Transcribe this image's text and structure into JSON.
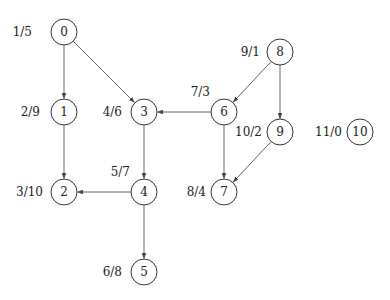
{
  "graph": {
    "type": "directed",
    "nodes": [
      {
        "id": "0",
        "x": 64,
        "y": 32,
        "label": "1/5",
        "lx": 32,
        "ly": 36,
        "anchor": "end"
      },
      {
        "id": "1",
        "x": 64,
        "y": 112,
        "label": "2/9",
        "lx": 40,
        "ly": 116,
        "anchor": "end"
      },
      {
        "id": "2",
        "x": 64,
        "y": 192,
        "label": "3/10",
        "lx": 43,
        "ly": 196,
        "anchor": "end"
      },
      {
        "id": "3",
        "x": 144,
        "y": 112,
        "label": "4/6",
        "lx": 122,
        "ly": 116,
        "anchor": "end"
      },
      {
        "id": "4",
        "x": 144,
        "y": 192,
        "label": "5/7",
        "lx": 130,
        "ly": 176,
        "anchor": "end"
      },
      {
        "id": "5",
        "x": 144,
        "y": 272,
        "label": "6/8",
        "lx": 122,
        "ly": 276,
        "anchor": "end"
      },
      {
        "id": "6",
        "x": 224,
        "y": 112,
        "label": "7/3",
        "lx": 210,
        "ly": 96,
        "anchor": "end"
      },
      {
        "id": "7",
        "x": 224,
        "y": 192,
        "label": "8/4",
        "lx": 206,
        "ly": 196,
        "anchor": "end"
      },
      {
        "id": "8",
        "x": 280,
        "y": 52,
        "label": "9/1",
        "lx": 260,
        "ly": 56,
        "anchor": "end"
      },
      {
        "id": "9",
        "x": 280,
        "y": 132,
        "label": "10/2",
        "lx": 262,
        "ly": 136,
        "anchor": "end"
      },
      {
        "id": "10",
        "x": 360,
        "y": 132,
        "label": "11/0",
        "lx": 342,
        "ly": 136,
        "anchor": "end"
      }
    ],
    "edges": [
      {
        "from": "0",
        "to": "1"
      },
      {
        "from": "0",
        "to": "3"
      },
      {
        "from": "1",
        "to": "2"
      },
      {
        "from": "3",
        "to": "4"
      },
      {
        "from": "4",
        "to": "2"
      },
      {
        "from": "4",
        "to": "5"
      },
      {
        "from": "6",
        "to": "3"
      },
      {
        "from": "6",
        "to": "7"
      },
      {
        "from": "8",
        "to": "6"
      },
      {
        "from": "8",
        "to": "9"
      },
      {
        "from": "9",
        "to": "7"
      }
    ],
    "node_radius": 13
  }
}
